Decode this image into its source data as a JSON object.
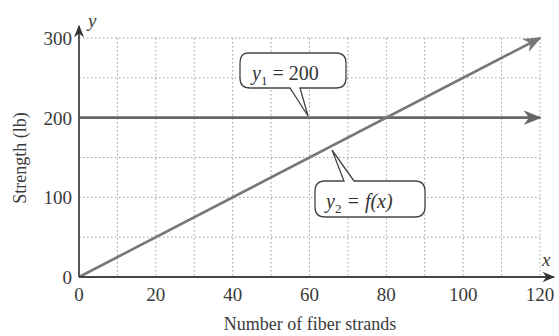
{
  "chart_data": {
    "type": "line",
    "title": "",
    "xlabel": "Number of fiber strands",
    "ylabel": "Strength (lb)",
    "x_axis_var": "x",
    "y_axis_var": "y",
    "xlim": [
      0,
      120
    ],
    "ylim": [
      0,
      300
    ],
    "xticks": [
      0,
      20,
      40,
      60,
      80,
      100,
      120
    ],
    "yticks": [
      0,
      100,
      200,
      300
    ],
    "x_tick_labels": [
      "0",
      "20",
      "40",
      "60",
      "80",
      "100",
      "120"
    ],
    "y_tick_labels": [
      "0",
      "100",
      "200",
      "300"
    ],
    "grid": true,
    "grid_minor_x_step": 10,
    "grid_minor_y_step": 50,
    "series": [
      {
        "name": "y1 = 200",
        "label_sub": "1",
        "label_rest": " = 200",
        "x": [
          0,
          120
        ],
        "y": [
          200,
          200
        ],
        "color": "#666666"
      },
      {
        "name": "y2 = f(x)",
        "label_sub": "2",
        "label_rest": " = f(x)",
        "x": [
          0,
          120
        ],
        "y": [
          0,
          300
        ],
        "color": "#777777"
      }
    ],
    "annotations": [
      {
        "text": "y1 = 200",
        "points_to": [
          60,
          200
        ]
      },
      {
        "text": "y2 = f(x)",
        "points_to": [
          55,
          130
        ]
      }
    ],
    "intersection": [
      80,
      200
    ]
  },
  "labels": {
    "xlabel": "Number of fiber strands",
    "ylabel": "Strength (lb)",
    "xvar": "x",
    "yvar": "y",
    "origin_y": "0",
    "callout1_y": "y",
    "callout1_sub": "1",
    "callout1_rest": " = 200",
    "callout2_y": "y",
    "callout2_sub": "2",
    "callout2_rest": " = f(x)"
  }
}
